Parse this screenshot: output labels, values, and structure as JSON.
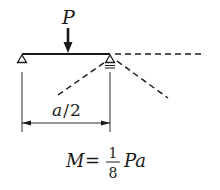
{
  "diagram": {
    "type": "beam-moment-diagram",
    "load": {
      "label": "P",
      "position_note": "midspan of beam segment"
    },
    "dimension": {
      "label": "a/2",
      "label_parts": {
        "numerator": "a",
        "slash": "/",
        "denominator": "2"
      }
    },
    "supports": [
      {
        "name": "left-support",
        "kind": "pin"
      },
      {
        "name": "right-support",
        "kind": "roller"
      }
    ],
    "formula": {
      "lhs": "M",
      "equals": "=",
      "fraction_numerator": "1",
      "fraction_denominator": "8",
      "rhs_tail": "Pa",
      "full_text": "M = 1/8 Pa"
    },
    "colors": {
      "stroke": "#1a1a1a",
      "background": "#ffffff"
    }
  }
}
